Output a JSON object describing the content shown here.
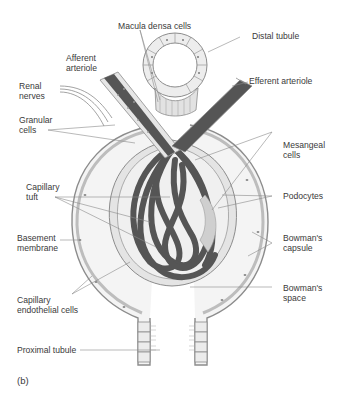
{
  "figure": {
    "panel_label": "(b)",
    "colors": {
      "vessel": "#5a5a5a",
      "vessel_dark": "#444444",
      "cell_fill": "#e8e8e8",
      "space_fill": "#f3f3f3",
      "line": "#8a8a8a",
      "text": "#3a3a3a"
    }
  },
  "labels": {
    "macula_densa": "Macula densa cells",
    "distal_tubule": "Distal tubule",
    "afferent_arteriole": "Afferent\narteriole",
    "efferent_arteriole": "Efferent arteriole",
    "renal_nerves": "Renal\nnerves",
    "granular_cells": "Granular\ncells",
    "mesangeal_cells": "Mesangeal\ncells",
    "capillary_tuft": "Capillary\ntuft",
    "podocytes": "Podocytes",
    "basement_membrane": "Basement\nmembrane",
    "bowmans_capsule": "Bowman's\ncapsule",
    "capillary_endothelial": "Capillary\nendothelial cells",
    "bowmans_space": "Bowman's\nspace",
    "proximal_tubule": "Proximal tubule"
  }
}
